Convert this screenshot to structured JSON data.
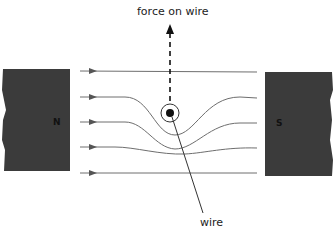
{
  "diagram": {
    "title_label": "force on wire",
    "wire_label": "wire",
    "north_pole": "N",
    "south_pole": "S",
    "colors": {
      "magnet": "#3b3b3b",
      "field_line": "#6e6e6e",
      "arrow": "#555555",
      "force_arrow": "#111111",
      "wire_dot": "#111111"
    }
  }
}
